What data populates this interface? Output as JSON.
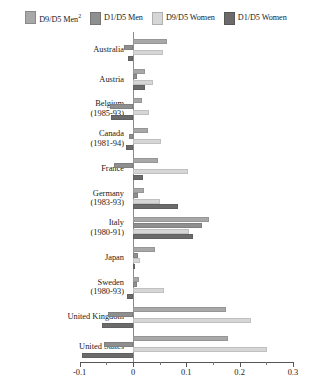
{
  "legend": {
    "items": [
      {
        "label": "D9/D5 Men",
        "superscript": "2",
        "color": "#a8a8a8",
        "key": "d9d5_men"
      },
      {
        "label": "D1/D5 Men",
        "superscript": "",
        "color": "#8f8f8f",
        "key": "d1d5_men"
      },
      {
        "label": "D9/D5 Women",
        "superscript": "",
        "color": "#d6d6d6",
        "key": "d9d5_women"
      },
      {
        "label": "D1/D5 Women",
        "superscript": "",
        "color": "#6b6b6b",
        "key": "d1d5_women"
      }
    ]
  },
  "axis": {
    "min": -0.1,
    "max": 0.3,
    "major_ticks": [
      -0.1,
      0,
      0.1,
      0.2,
      0.3
    ],
    "major_tick_labels": [
      "-0.1",
      "0",
      "0.1",
      "0.2",
      "0.3"
    ],
    "minor_ticks": [
      -0.05,
      0.05,
      0.15,
      0.25
    ],
    "zero": 0
  },
  "chart_data": {
    "type": "bar",
    "orientation": "horizontal",
    "title": "",
    "subtitle": "",
    "xlabel": "",
    "ylabel": "",
    "xlim": [
      -0.1,
      0.3
    ],
    "grid": false,
    "legend_position": "top",
    "categories": [
      "Australia",
      "Austria",
      "Belgium",
      "Canada",
      "France",
      "Germany",
      "Italy",
      "Japan",
      "Sweden",
      "United Kingdom",
      "United States"
    ],
    "category_years": [
      "",
      "",
      "(1985-93)",
      "(1981-94)",
      "",
      "(1983-93)",
      "(1980-91)",
      "",
      "(1980-93)",
      "",
      ""
    ],
    "series": [
      {
        "name": "D9/D5 Men",
        "values": [
          0.064,
          0.022,
          0.016,
          0.028,
          0.046,
          0.02,
          0.143,
          0.042,
          0.012,
          0.175,
          0.178
        ]
      },
      {
        "name": "D1/D5 Men",
        "values": [
          -0.016,
          0.008,
          -0.044,
          -0.008,
          -0.035,
          0.01,
          0.13,
          0.01,
          0.008,
          -0.047,
          -0.055
        ]
      },
      {
        "name": "D9/D5 Women",
        "values": [
          0.057,
          0.038,
          0.03,
          0.053,
          0.103,
          0.05,
          0.105,
          0.013,
          0.058,
          0.222,
          0.252
        ]
      },
      {
        "name": "D1/D5 Women",
        "values": [
          -0.01,
          0.022,
          -0.042,
          -0.014,
          0.018,
          0.085,
          0.112,
          0.004,
          -0.012,
          -0.058,
          -0.095
        ]
      }
    ]
  }
}
